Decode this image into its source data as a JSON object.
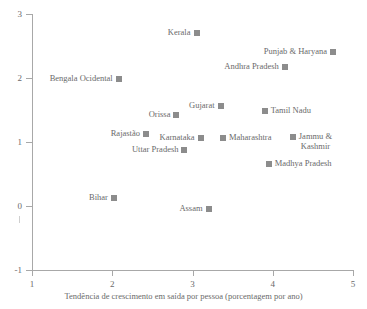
{
  "chart_data": {
    "type": "scatter",
    "title": "",
    "xlabel": "Tendência de crescimento em saída por pessoa (porcentagem por ano)",
    "ylabel": "",
    "xlim": [
      1,
      5
    ],
    "ylim": [
      -1,
      3
    ],
    "xticks": [
      "1",
      "2",
      "3",
      "4",
      "5"
    ],
    "yticks": [
      "3",
      "2",
      "1",
      "0",
      "-1"
    ],
    "grid": false,
    "legend": "none",
    "marker_color": "#8c8c8c",
    "axis_color": "#a8a8a8",
    "text_color": "#6a6a6a",
    "points": [
      {
        "label": "Kerala",
        "x": 3.05,
        "y": 2.7,
        "label_side": "left"
      },
      {
        "label": "Punjab & Haryana",
        "x": 4.75,
        "y": 2.4,
        "label_side": "left"
      },
      {
        "label": "Andhra Pradesh",
        "x": 4.15,
        "y": 2.17,
        "label_side": "left"
      },
      {
        "label": "Bengala Ocidental",
        "x": 2.08,
        "y": 1.98,
        "label_side": "left"
      },
      {
        "label": "Gujarat",
        "x": 3.35,
        "y": 1.57,
        "label_side": "left"
      },
      {
        "label": "Tamil Nadu",
        "x": 3.9,
        "y": 1.48,
        "label_side": "right"
      },
      {
        "label": "Orissa",
        "x": 2.8,
        "y": 1.42,
        "label_side": "left"
      },
      {
        "label": "Rajastão",
        "x": 2.42,
        "y": 1.13,
        "label_side": "left"
      },
      {
        "label": "Karnataka",
        "x": 3.1,
        "y": 1.07,
        "label_side": "left"
      },
      {
        "label": "Maharashtra",
        "x": 3.38,
        "y": 1.07,
        "label_side": "right"
      },
      {
        "label": "Jammu &\nKashmir",
        "x": 4.25,
        "y": 1.08,
        "label_side": "right"
      },
      {
        "label": "Uttar Pradesh",
        "x": 2.9,
        "y": 0.87,
        "label_side": "left"
      },
      {
        "label": "Madhya Pradesh",
        "x": 3.95,
        "y": 0.65,
        "label_side": "right"
      },
      {
        "label": "Bihar",
        "x": 2.02,
        "y": 0.12,
        "label_side": "left"
      },
      {
        "label": "Assam",
        "x": 3.2,
        "y": -0.05,
        "label_side": "left"
      }
    ]
  },
  "axis": {
    "x_title": "Tendência de crescimento em saída por pessoa (porcentagem por ano)",
    "x_tick_labels": [
      "1",
      "2",
      "3",
      "4",
      "5"
    ],
    "y_tick_labels": [
      "3",
      "2",
      "1",
      "0",
      "-1"
    ]
  }
}
